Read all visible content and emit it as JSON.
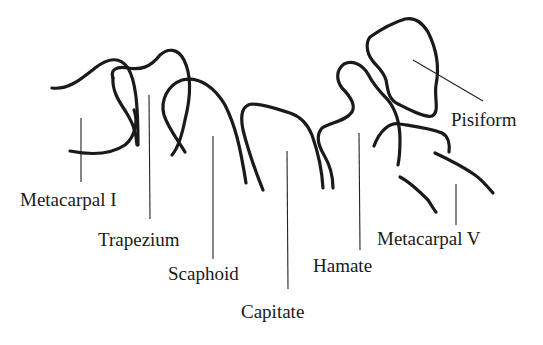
{
  "diagram": {
    "labels": [
      {
        "id": "metacarpal-i",
        "text": "Metacarpal I",
        "x": 20,
        "y": 191
      },
      {
        "id": "trapezium",
        "text": "Trapezium",
        "x": 98,
        "y": 230
      },
      {
        "id": "scaphoid",
        "text": "Scaphoid",
        "x": 168,
        "y": 264
      },
      {
        "id": "capitate",
        "text": "Capitate",
        "x": 241,
        "y": 305
      },
      {
        "id": "hamate",
        "text": "Hamate",
        "x": 313,
        "y": 257
      },
      {
        "id": "metacarpal-v",
        "text": "Metacarpal V",
        "x": 377,
        "y": 229
      },
      {
        "id": "pisiform",
        "text": "Pisiform",
        "x": 451,
        "y": 111
      }
    ]
  }
}
